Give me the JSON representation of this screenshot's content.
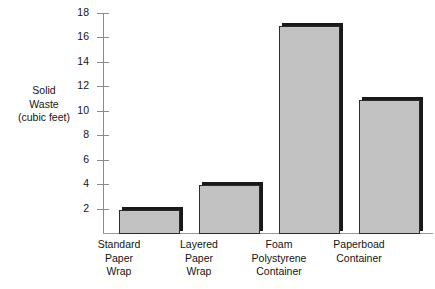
{
  "chart_data": {
    "type": "bar",
    "title": "",
    "subtitle": "",
    "xlabel": "",
    "ylabel": "Solid Waste (cubic feet)",
    "ylabel_lines": [
      "Solid",
      "Waste",
      "(cubic feet)"
    ],
    "categories": [
      "Standard Paper Wrap",
      "Layered Paper Wrap",
      "Foam Polystyrene Container",
      "Paperboad Container"
    ],
    "category_lines": [
      [
        "Standard",
        "Paper",
        "Wrap"
      ],
      [
        "Layered",
        "Paper",
        "Wrap"
      ],
      [
        "Foam",
        "Polystyrene",
        "Container"
      ],
      [
        "Paperboad",
        "Container"
      ]
    ],
    "values": [
      2,
      4,
      17,
      11
    ],
    "ylim": [
      0,
      18
    ],
    "ytick_values": [
      18,
      16,
      14,
      12,
      10,
      8,
      6,
      4,
      2
    ],
    "ytick_labels": [
      "18",
      "16",
      "14",
      "12",
      "10",
      "8",
      "6",
      "4",
      "2"
    ],
    "grid": false,
    "legend": null,
    "legend_position": "none",
    "bar_fill_color": "#c2c2c2",
    "bar_edge_color": "#2b2b2b",
    "bar_shadow_color": "#191919",
    "axis_color": "#8c8c8c",
    "background_color": "#ffffff"
  }
}
